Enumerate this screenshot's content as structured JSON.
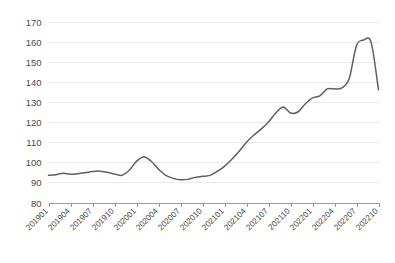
{
  "chart_data": {
    "type": "line",
    "title": "",
    "subtitle": "",
    "xlabel": "",
    "ylabel": "",
    "ylim": [
      80,
      170
    ],
    "ytick_step": 10,
    "ytick_labels": [
      "170",
      "160",
      "150",
      "140",
      "130",
      "120",
      "110",
      "100",
      "90",
      "80"
    ],
    "grid": true,
    "legend": false,
    "legend_position": "none",
    "line_color": "#5f5f5f",
    "grid_color": "#e9e9e9",
    "axis_color": "#9a9a9a",
    "x_tick_interval_months": 3,
    "xtick_labels": [
      "201901",
      "201904",
      "201907",
      "201910",
      "202001",
      "202004",
      "202007",
      "202010",
      "202101",
      "202104",
      "202107",
      "202110",
      "202201",
      "202204",
      "202207",
      "202210"
    ],
    "x": [
      "201901",
      "201902",
      "201903",
      "201904",
      "201905",
      "201906",
      "201907",
      "201908",
      "201909",
      "201910",
      "201911",
      "201912",
      "202001",
      "202002",
      "202003",
      "202004",
      "202005",
      "202006",
      "202007",
      "202008",
      "202009",
      "202010",
      "202011",
      "202012",
      "202101",
      "202102",
      "202103",
      "202104",
      "202105",
      "202106",
      "202107",
      "202108",
      "202109",
      "202110",
      "202111",
      "202112",
      "202201",
      "202202",
      "202203",
      "202204",
      "202205",
      "202206",
      "202207",
      "202208",
      "202209",
      "202210"
    ],
    "values": [
      93.5,
      93.8,
      94.5,
      94.0,
      94.3,
      94.8,
      95.4,
      95.6,
      95.0,
      94.2,
      93.5,
      96.0,
      100.5,
      102.8,
      100.5,
      96.5,
      93.5,
      92.0,
      91.3,
      91.5,
      92.5,
      93.0,
      93.5,
      95.5,
      98.0,
      101.5,
      105.5,
      110.0,
      113.5,
      116.5,
      120.0,
      124.5,
      127.5,
      124.5,
      125.0,
      129.0,
      132.0,
      133.0,
      136.5,
      136.5,
      137.0,
      141.5,
      158.0,
      160.8,
      159.5,
      136.0
    ],
    "series": [
      {
        "name": "series-1",
        "values": [
          93.5,
          93.8,
          94.5,
          94.0,
          94.3,
          94.8,
          95.4,
          95.6,
          95.0,
          94.2,
          93.5,
          96.0,
          100.5,
          102.8,
          100.5,
          96.5,
          93.5,
          92.0,
          91.3,
          91.5,
          92.5,
          93.0,
          93.5,
          95.5,
          98.0,
          101.5,
          105.5,
          110.0,
          113.5,
          116.5,
          120.0,
          124.5,
          127.5,
          124.5,
          125.0,
          129.0,
          132.0,
          133.0,
          136.5,
          136.5,
          137.0,
          141.5,
          158.0,
          160.8,
          159.5,
          136.0
        ]
      }
    ]
  }
}
